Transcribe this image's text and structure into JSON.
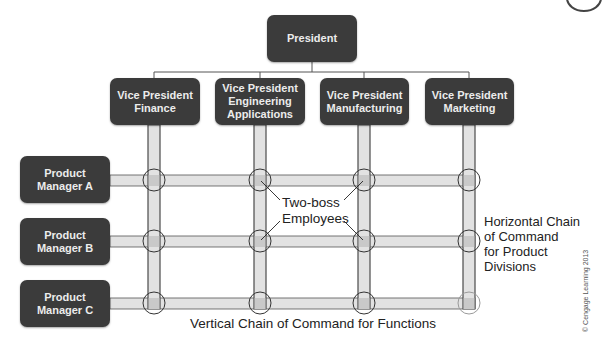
{
  "diagram": {
    "type": "matrix-organization-chart",
    "president": {
      "label": "President"
    },
    "vice_presidents": [
      {
        "label": "Vice President\nFinance"
      },
      {
        "label": "Vice President\nEngineering\nApplications"
      },
      {
        "label": "Vice President\nManufacturing"
      },
      {
        "label": "Vice President\nMarketing"
      }
    ],
    "product_managers": [
      {
        "label": "Product\nManager A"
      },
      {
        "label": "Product\nManager B"
      },
      {
        "label": "Product\nManager C"
      }
    ],
    "annotations": {
      "two_boss": "Two-boss\nEmployees",
      "horizontal_chain": "Horizontal Chain\nof Command\nfor Product\nDivisions",
      "vertical_chain": "Vertical Chain of Command for Functions"
    },
    "copyright": "© Cengage Learning 2013"
  },
  "colors": {
    "box_fill": "#3b3b3b",
    "box_text": "#ececec",
    "bar_fill": "#e2e2e2",
    "bar_stroke": "#555555",
    "crossing_fill": "#c9c9c9",
    "circle_stroke": "#333333",
    "circle_stroke_light": "#9a9a9a"
  }
}
